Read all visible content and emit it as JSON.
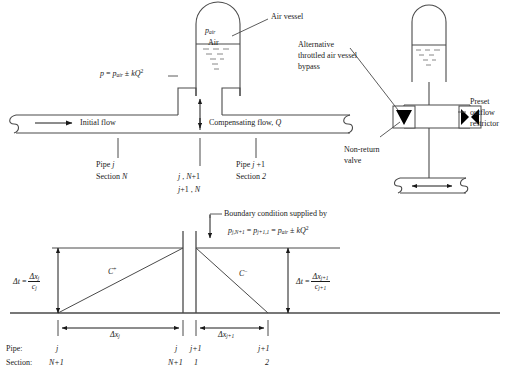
{
  "figure": {
    "ink_color": "#1a1a1a",
    "line_color": "#4a4a4a",
    "fill_black": "#000000",
    "background": "#ffffff"
  },
  "top_diagram": {
    "air_vessel": {
      "pressure_label": "p",
      "pressure_sub": "air",
      "gas_label": "Air",
      "vessel_name": "Air vessel"
    },
    "pressure_equation": {
      "lhs": "p",
      "eq": "=",
      "rhs_p": "p",
      "rhs_sub": "air",
      "pm": "±",
      "k": "k",
      "q": "Q",
      "exp": "2",
      "full": "p = p_air ± kQ²"
    },
    "pipe": {
      "initial_flow_label": "Initial flow",
      "compensating_flow_label": "Compensating flow,",
      "compensating_flow_symbol": "Q"
    },
    "stations": [
      {
        "name": "station-left",
        "line1": "Pipe j",
        "line2": "Section N"
      },
      {
        "name": "station-middle",
        "line1": "j , N+1",
        "line2": "j+1 , N"
      },
      {
        "name": "station-right",
        "line1": "Pipe j +1",
        "line2": "Section 2"
      }
    ]
  },
  "right_diagram": {
    "callouts": {
      "alternative_bypass": [
        "Alternative",
        "throttled air vessel",
        "bypass"
      ],
      "non_return_valve": [
        "Non-return",
        "valve"
      ],
      "preset_restrictor": [
        "Preset",
        "outflow",
        "restrictor"
      ]
    },
    "symbols": {
      "non_return_valve_icon": "filled-triangle-valve",
      "restrictor_icon": "bowtie-restrictor"
    }
  },
  "bottom_diagram": {
    "boundary_note": "Boundary condition supplied by",
    "boundary_equation": {
      "term1_p": "p",
      "term1_sub": "j,N+1",
      "eq1": "=",
      "term2_p": "p",
      "term2_sub": "j+1,1",
      "eq2": "=",
      "term3_p": "p",
      "term3_sub": "air",
      "pm": "±",
      "k": "k",
      "q": "Q",
      "exp": "2",
      "full": "p_{j,N+1} = p_{j+1,1} = p_air ± kQ²"
    },
    "characteristics": [
      {
        "name": "c-plus",
        "label": "C",
        "superscript": "+"
      },
      {
        "name": "c-minus",
        "label": "C",
        "superscript": "−"
      }
    ],
    "dt_left": {
      "lhs_delta": "Δt",
      "eq": "=",
      "num_delta": "Δx",
      "num_sub": "j",
      "den": "c",
      "den_sub": "j",
      "full": "Δt = Δx_j / c_j"
    },
    "dt_right": {
      "lhs_delta": "Δt",
      "eq": "=",
      "num_delta": "Δx",
      "num_sub": "j+1",
      "den": "c",
      "den_sub": "j+1",
      "full": "Δt = Δx_j+1 / c_j+1"
    },
    "dx_left": {
      "delta": "Δx",
      "sub": "j"
    },
    "dx_right": {
      "delta": "Δx",
      "sub": "j+1"
    },
    "axis_titles": {
      "pipe": "Pipe:",
      "section": "Section:"
    },
    "axis_marks": [
      {
        "name": "mark-1",
        "pipe": "j",
        "section": "N+1"
      },
      {
        "name": "mark-2",
        "pipe": "j",
        "section": "N+1"
      },
      {
        "name": "mark-3",
        "pipe": "j+1",
        "section": "1"
      },
      {
        "name": "mark-4",
        "pipe": "j+1",
        "section": "2"
      }
    ]
  }
}
